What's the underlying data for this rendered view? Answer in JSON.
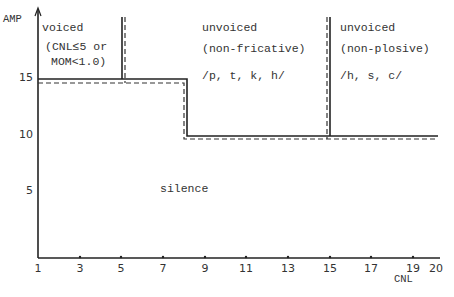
{
  "axes": {
    "y_label": "AMP",
    "x_label": "CNL",
    "x_ticks": [
      "1",
      "3",
      "5",
      "7",
      "9",
      "11",
      "13",
      "15",
      "17",
      "19",
      "20"
    ],
    "y_ticks": [
      "15",
      "10",
      "5"
    ]
  },
  "regions": {
    "voiced": {
      "title": "voiced",
      "line1": "(CNL≤5 or",
      "line2": "MOM<1.0)"
    },
    "unvoiced_nonfricative": {
      "title": "unvoiced",
      "subtitle": "(non-fricative)",
      "phonemes": "/p, t, k, h/"
    },
    "unvoiced_nonplosive": {
      "title": "unvoiced",
      "subtitle": "(non-plosive)",
      "phonemes": "/h, s, c/"
    },
    "silence": {
      "label": "silence"
    }
  },
  "thresholds": {
    "solid": [
      {
        "x_from": 1,
        "x_to": 8,
        "amp": 15
      },
      {
        "x_from": 8,
        "x_to": 20,
        "amp": 10
      }
    ],
    "dashed": [
      {
        "x_from": 1,
        "x_to": 7.5,
        "amp": 14.5
      },
      {
        "x_from": 7.5,
        "x_to": 20,
        "amp": 9.5
      }
    ],
    "boundaries": [
      {
        "cnl": 5,
        "type": "voiced"
      },
      {
        "cnl": 15,
        "type": "plosive"
      }
    ]
  }
}
